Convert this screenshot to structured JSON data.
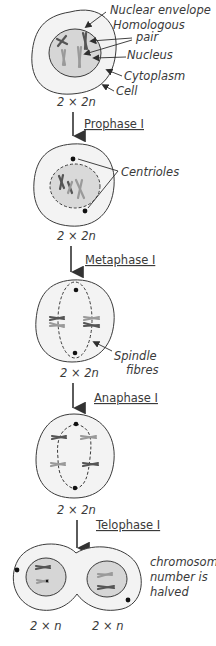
{
  "labels": {
    "nuclear_envelope": "Nuclear envelope",
    "homologous_pair_line1": "Homologous",
    "homologous_pair_line2": "pair",
    "nucleus": "Nucleus",
    "cytoplasm": "Cytoplasm",
    "cell": "Cell",
    "centrioles": "Centrioles",
    "spindle_line1": "Spindle",
    "spindle_line2": "fibres",
    "halved_line1": "chromosome",
    "halved_line2": "number is",
    "halved_line3": "halved"
  },
  "stages": [
    {
      "name": "Prophase I"
    },
    {
      "name": "Metaphase I"
    },
    {
      "name": "Anaphase I"
    },
    {
      "name": "Telophase I"
    }
  ],
  "ploidy": {
    "initial": "2 × 2n",
    "after_prophase": "2 × 2n",
    "after_metaphase": "2 × 2n",
    "after_anaphase": "2 × 2n",
    "daughter_left": "2 × n",
    "daughter_right": "2 × n"
  },
  "colors": {
    "outline": "#3b3b3b",
    "cytoplasm": "#f3f3f3",
    "nucleus": "#d6d6d6",
    "text": "#3a3a3a"
  }
}
